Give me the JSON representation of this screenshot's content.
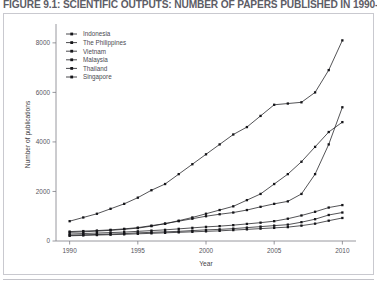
{
  "figure": {
    "caption": "FIGURE 9.1: SCIENTIFIC OUTPUTS: NUMBER OF PAPERS PUBLISHED IN 1990-2010"
  },
  "chart_data": {
    "type": "line",
    "title": "",
    "xlabel": "Year",
    "ylabel": "Number of publications",
    "xlim": [
      1989,
      2011
    ],
    "ylim": [
      0,
      8600
    ],
    "xticks": [
      1990,
      1995,
      2000,
      2005,
      2010
    ],
    "yticks": [
      0,
      2000,
      4000,
      6000,
      8000
    ],
    "grid": false,
    "legend_position": "top-left",
    "x": [
      1990,
      1991,
      1992,
      1993,
      1994,
      1995,
      1996,
      1997,
      1998,
      1999,
      2000,
      2001,
      2002,
      2003,
      2004,
      2005,
      2006,
      2007,
      2008,
      2009,
      2010
    ],
    "series": [
      {
        "name": "Indonesia",
        "values": [
          230,
          250,
          265,
          280,
          300,
          330,
          350,
          370,
          390,
          420,
          450,
          470,
          500,
          540,
          580,
          620,
          660,
          760,
          880,
          1050,
          1150
        ]
      },
      {
        "name": "The Philippines",
        "values": [
          210,
          225,
          240,
          255,
          270,
          290,
          310,
          330,
          350,
          370,
          390,
          410,
          440,
          470,
          500,
          530,
          560,
          620,
          700,
          820,
          930
        ]
      },
      {
        "name": "Vietnam",
        "values": [
          280,
          300,
          320,
          340,
          360,
          390,
          420,
          450,
          490,
          530,
          570,
          600,
          640,
          690,
          740,
          800,
          900,
          1030,
          1180,
          1350,
          1450
        ]
      },
      {
        "name": "Malaysia",
        "values": [
          380,
          400,
          420,
          450,
          490,
          540,
          620,
          700,
          800,
          900,
          1000,
          1080,
          1150,
          1250,
          1380,
          1500,
          1600,
          1900,
          2700,
          3900,
          5400
        ]
      },
      {
        "name": "Thailand",
        "values": [
          350,
          370,
          400,
          430,
          470,
          520,
          600,
          700,
          820,
          950,
          1100,
          1250,
          1400,
          1650,
          1900,
          2300,
          2700,
          3200,
          3800,
          4400,
          4800
        ]
      },
      {
        "name": "Singapore",
        "values": [
          800,
          950,
          1100,
          1300,
          1500,
          1750,
          2050,
          2300,
          2700,
          3100,
          3500,
          3900,
          4300,
          4600,
          5050,
          5500,
          5550,
          5600,
          6000,
          6900,
          8100
        ]
      }
    ]
  }
}
